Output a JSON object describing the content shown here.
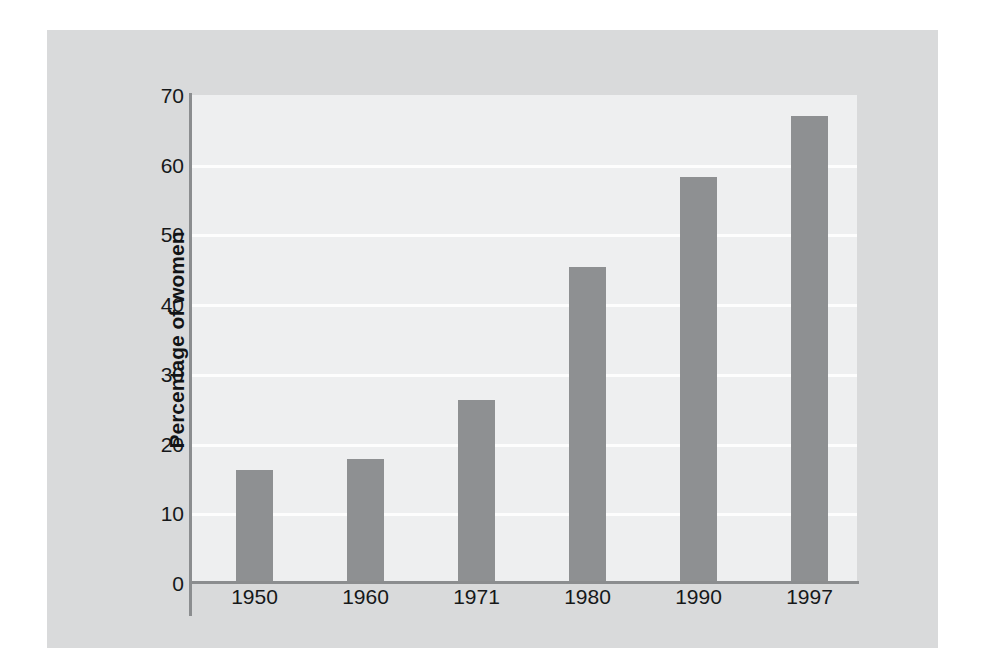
{
  "chart_data": {
    "type": "bar",
    "title": "",
    "subtitle": "",
    "xlabel": "",
    "ylabel": "Percentage of women",
    "categories": [
      "1950",
      "1960",
      "1971",
      "1980",
      "1990",
      "1997"
    ],
    "values": [
      16.2,
      17.8,
      26.3,
      45.4,
      58.3,
      67.0
    ],
    "series": [
      {
        "name": "Percentage of women",
        "values": [
          16.2,
          17.8,
          26.3,
          45.4,
          58.3,
          67.0
        ]
      }
    ],
    "ylim": [
      0,
      70
    ],
    "yticks": [
      0,
      10,
      20,
      30,
      40,
      50,
      60,
      70
    ],
    "ytick_labels": [
      "0",
      "10",
      "20",
      "30",
      "40",
      "50",
      "60",
      "70"
    ],
    "grid": "horizontal",
    "legend": "none",
    "bar_color": "#8e9092",
    "plot_background": "#eeeff0",
    "panel_background": "#d9dadb",
    "gridline_color": "#fdfdfd",
    "axis_color": "#8b8d8f",
    "text_color": "#16181a"
  }
}
